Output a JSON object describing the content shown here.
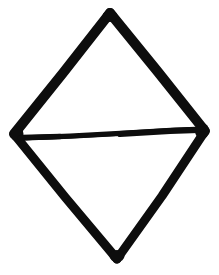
{
  "canvas": {
    "width": 219,
    "height": 275,
    "background_color": "#ffffff",
    "description": "Hand-drawn black ink diamond (rhombus) with a horizontal line across its middle"
  },
  "figure": {
    "name": "diamond-with-horizontal-chord",
    "stroke_color": "#0d0d0d",
    "fill": "none",
    "style": "hand-drawn marker",
    "vertices": {
      "top": {
        "x": 110,
        "y": 13
      },
      "left": {
        "x": 14,
        "y": 134
      },
      "right": {
        "x": 205,
        "y": 131
      },
      "bottom": {
        "x": 117,
        "y": 259
      }
    },
    "strokes": [
      {
        "name": "edge-top-left",
        "from": "top",
        "to": "left",
        "width": 10,
        "path": "M110,13 L63,73 L14,134"
      },
      {
        "name": "edge-top-right",
        "from": "top",
        "to": "right",
        "width": 10,
        "path": "M110,13 L158,72 L205,131"
      },
      {
        "name": "edge-bottom-left",
        "from": "left",
        "to": "bottom",
        "width": 9,
        "path": "M14,134 L65,197 L117,259"
      },
      {
        "name": "edge-bottom-right",
        "from": "right",
        "to": "bottom",
        "width": 9,
        "path": "M205,131 L162,196 L117,259"
      },
      {
        "name": "chord-horizontal-middle",
        "from": "left",
        "to": "right",
        "width": 5,
        "path": "M20,138 L70,136 L125,133 L175,130 L203,129"
      }
    ]
  }
}
